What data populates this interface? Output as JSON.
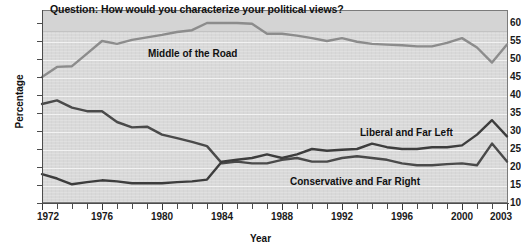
{
  "chart_data": {
    "type": "line",
    "title": "Question: How would you characterize your political views?",
    "xlabel": "Year",
    "ylabel": "Percentage",
    "ylim": [
      10,
      60
    ],
    "xlim": [
      1972,
      2003
    ],
    "grid": true,
    "legend_position": "inline-labels",
    "y_ticks": [
      60,
      55,
      50,
      45,
      40,
      35,
      30,
      25,
      20,
      15,
      10
    ],
    "x_ticks": [
      1972,
      1976,
      1980,
      1984,
      1988,
      1992,
      1996,
      2000,
      2003
    ],
    "x_tick_labels": [
      "1972",
      "1976",
      "1980",
      "1984",
      "1988",
      "1992",
      "1996",
      "2000",
      "2003"
    ],
    "x": [
      1972,
      1973,
      1974,
      1975,
      1976,
      1977,
      1978,
      1979,
      1980,
      1981,
      1982,
      1983,
      1984,
      1985,
      1986,
      1987,
      1988,
      1989,
      1990,
      1991,
      1992,
      1993,
      1994,
      1995,
      1996,
      1997,
      1998,
      1999,
      2000,
      2001,
      2002,
      2003
    ],
    "series": [
      {
        "name": "Middle of the Road",
        "color": "#8c8c8c",
        "values": [
          45.0,
          47.8,
          48.0,
          51.5,
          55.0,
          54.2,
          55.3,
          56.0,
          56.7,
          57.5,
          58.0,
          60.0,
          60.0,
          60.0,
          59.8,
          57.0,
          57.0,
          56.5,
          55.8,
          55.0,
          55.8,
          54.8,
          54.2,
          54.0,
          53.8,
          53.5,
          53.5,
          54.5,
          55.8,
          53.2,
          49.0,
          54.0
        ]
      },
      {
        "name": "Conservative and Far Right",
        "color": "#4a4a4a",
        "values": [
          37.5,
          38.5,
          36.5,
          35.5,
          35.5,
          32.5,
          31.0,
          31.2,
          29.0,
          28.0,
          27.0,
          25.8,
          21.0,
          21.5,
          21.0,
          21.0,
          22.0,
          22.5,
          21.5,
          21.5,
          22.5,
          23.0,
          22.5,
          22.0,
          21.0,
          20.5,
          20.5,
          20.8,
          21.0,
          20.5,
          26.5,
          21.5
        ]
      },
      {
        "name": "Liberal and Far Left",
        "color": "#3d3d3d",
        "values": [
          18.0,
          16.8,
          15.2,
          15.8,
          16.3,
          16.0,
          15.5,
          15.5,
          15.5,
          15.8,
          16.0,
          16.5,
          21.5,
          22.0,
          22.5,
          23.5,
          22.5,
          23.5,
          25.0,
          24.5,
          24.8,
          25.0,
          26.5,
          25.5,
          25.0,
          25.0,
          25.5,
          25.5,
          26.0,
          29.0,
          33.0,
          28.5
        ]
      }
    ],
    "series_labels": {
      "middle": "Middle of the Road",
      "liberal": "Liberal and Far Left",
      "conservative": "Conservative and Far Right"
    }
  }
}
